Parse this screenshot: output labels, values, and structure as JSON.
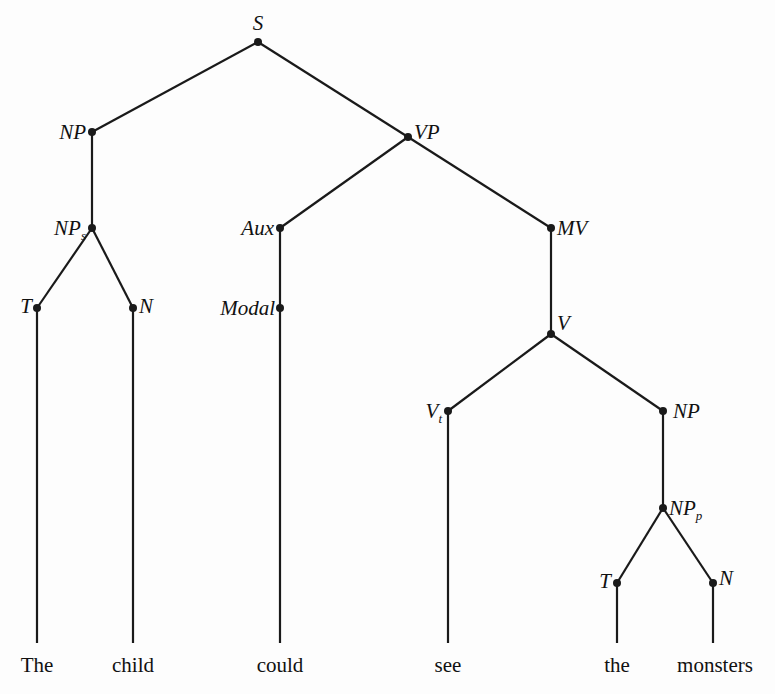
{
  "diagram": {
    "type": "phrase-structure-tree",
    "nodes": [
      {
        "id": "S",
        "label": "S",
        "sub": ""
      },
      {
        "id": "NP1",
        "label": "NP",
        "sub": ""
      },
      {
        "id": "VP",
        "label": "VP",
        "sub": ""
      },
      {
        "id": "NPs",
        "label": "NP",
        "sub": "s"
      },
      {
        "id": "Aux",
        "label": "Aux",
        "sub": ""
      },
      {
        "id": "MV",
        "label": "MV",
        "sub": ""
      },
      {
        "id": "T1",
        "label": "T",
        "sub": ""
      },
      {
        "id": "N1",
        "label": "N",
        "sub": ""
      },
      {
        "id": "Modal",
        "label": "Modal",
        "sub": ""
      },
      {
        "id": "V",
        "label": "V",
        "sub": ""
      },
      {
        "id": "Vt",
        "label": "V",
        "sub": "t"
      },
      {
        "id": "NP2",
        "label": "NP",
        "sub": ""
      },
      {
        "id": "NPp",
        "label": "NP",
        "sub": "p"
      },
      {
        "id": "T2",
        "label": "T",
        "sub": ""
      },
      {
        "id": "N2",
        "label": "N",
        "sub": ""
      }
    ],
    "edges": [
      [
        "S",
        "NP1"
      ],
      [
        "S",
        "VP"
      ],
      [
        "NP1",
        "NPs"
      ],
      [
        "NPs",
        "T1"
      ],
      [
        "NPs",
        "N1"
      ],
      [
        "VP",
        "Aux"
      ],
      [
        "VP",
        "MV"
      ],
      [
        "Aux",
        "Modal"
      ],
      [
        "MV",
        "V"
      ],
      [
        "V",
        "Vt"
      ],
      [
        "V",
        "NP2"
      ],
      [
        "NP2",
        "NPp"
      ],
      [
        "NPp",
        "T2"
      ],
      [
        "NPp",
        "N2"
      ]
    ],
    "leaves": [
      {
        "parent": "T1",
        "word": "The"
      },
      {
        "parent": "N1",
        "word": "child"
      },
      {
        "parent": "Modal",
        "word": "could"
      },
      {
        "parent": "Vt",
        "word": "see"
      },
      {
        "parent": "T2",
        "word": "the"
      },
      {
        "parent": "N2",
        "word": "monsters"
      }
    ]
  }
}
